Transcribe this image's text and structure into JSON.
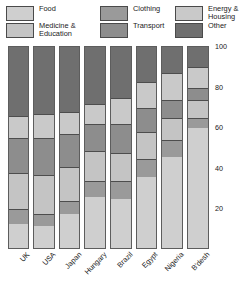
{
  "legend": {
    "position": "top",
    "items": [
      {
        "label": "Food",
        "key": "food",
        "color": "#cfcfcf",
        "x": 6,
        "y": 5
      },
      {
        "label": "Medicine &\nEducation",
        "key": "medicine",
        "color": "#c4c4c4",
        "x": 6,
        "y": 22
      },
      {
        "label": "Clothing",
        "key": "clothing",
        "color": "#9a9a9a",
        "x": 100,
        "y": 5
      },
      {
        "label": "Transport",
        "key": "transport",
        "color": "#8d8d8d",
        "x": 100,
        "y": 22
      },
      {
        "label": "Energy &\nHousing",
        "key": "energy",
        "color": "#c9c9c9",
        "x": 175,
        "y": 5
      },
      {
        "label": "Other",
        "key": "other",
        "color": "#6f6f6f",
        "x": 175,
        "y": 22
      }
    ]
  },
  "chart_data": {
    "type": "bar",
    "stacked": true,
    "title": "",
    "xlabel": "",
    "ylabel": "",
    "ylim": [
      0,
      100
    ],
    "yticks": [
      20,
      40,
      60,
      80,
      100
    ],
    "grid": false,
    "legend_position": "top",
    "categories": [
      "UK",
      "USA",
      "Japan",
      "Hungary",
      "Brazil",
      "Egypt",
      "Nigeria",
      "B'desh"
    ],
    "series": [
      {
        "name": "Food",
        "key": "food",
        "color": "#cfcfcf",
        "values": [
          12,
          11,
          17,
          25,
          24,
          35,
          45,
          59
        ]
      },
      {
        "name": "Clothing",
        "key": "clothing",
        "color": "#9a9a9a",
        "values": [
          7,
          6,
          6,
          8,
          9,
          9,
          8,
          5
        ]
      },
      {
        "name": "Medicine & Education",
        "key": "medicine",
        "color": "#c4c4c4",
        "values": [
          18,
          19,
          17,
          15,
          14,
          13,
          11,
          9
        ]
      },
      {
        "name": "Transport",
        "key": "transport",
        "color": "#8d8d8d",
        "values": [
          17,
          18,
          16,
          13,
          14,
          12,
          9,
          6
        ]
      },
      {
        "name": "Energy & Housing",
        "key": "energy",
        "color": "#c9c9c9",
        "values": [
          11,
          12,
          11,
          10,
          13,
          13,
          13,
          10
        ]
      },
      {
        "name": "Other",
        "key": "other",
        "color": "#6f6f6f",
        "values": [
          35,
          34,
          33,
          29,
          26,
          18,
          14,
          11
        ]
      }
    ]
  }
}
